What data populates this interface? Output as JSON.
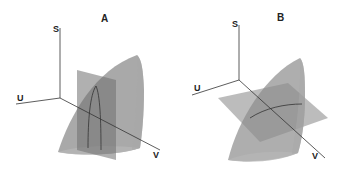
{
  "figure": {
    "panels": [
      {
        "id": "A",
        "title": "A",
        "axes": {
          "vertical": "S",
          "left": "U",
          "right": "V"
        },
        "plane_orientation": "vertical"
      },
      {
        "id": "B",
        "title": "B",
        "axes": {
          "vertical": "S",
          "left": "U",
          "right": "V"
        },
        "plane_orientation": "horizontal"
      }
    ],
    "colors": {
      "axis": "#333333",
      "surface": "#8a8a8a",
      "plane": "#7a7a7a",
      "intersection": "#333333"
    }
  }
}
